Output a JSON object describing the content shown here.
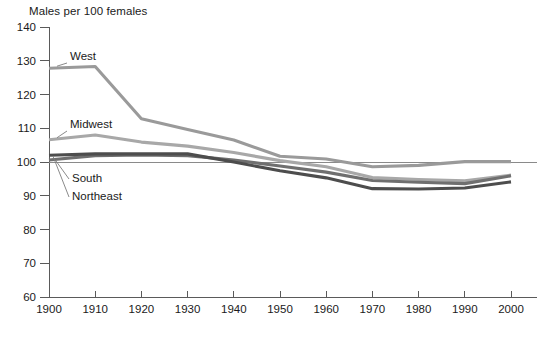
{
  "chart_data": {
    "type": "line",
    "title": "Males per 100 females",
    "xlabel": "",
    "ylabel": "Males per 100 females",
    "ylim": [
      60,
      140
    ],
    "xlim": [
      1900,
      2000
    ],
    "ytick_values": [
      60,
      70,
      80,
      90,
      100,
      110,
      120,
      130,
      140
    ],
    "ytick_labels": [
      "60",
      "70",
      "80",
      "90",
      "100",
      "110",
      "120",
      "130",
      "140"
    ],
    "grid": false,
    "reference_line": 100,
    "legend_position": "inline-labels",
    "categories": [
      1900,
      1910,
      1920,
      1930,
      1940,
      1950,
      1960,
      1970,
      1980,
      1990,
      2000
    ],
    "xtick_labels": [
      "1900",
      "1910",
      "1920",
      "1930",
      "1940",
      "1950",
      "1960",
      "1970",
      "1980",
      "1990",
      "2000"
    ],
    "series": [
      {
        "name": "West",
        "color": "#9a9a9a",
        "label": "West",
        "values": [
          127.8,
          128.3,
          112.8,
          109.6,
          106.5,
          101.7,
          100.9,
          98.6,
          99.0,
          100.1,
          100.1
        ]
      },
      {
        "name": "Midwest",
        "color": "#a8a8a8",
        "label": "Midwest",
        "values": [
          106.6,
          108.0,
          105.9,
          104.7,
          102.8,
          100.4,
          98.6,
          95.4,
          94.8,
          94.4,
          96.1
        ]
      },
      {
        "name": "South",
        "color": "#6f6f6f",
        "label": "South",
        "values": [
          100.6,
          101.9,
          102.1,
          101.9,
          100.6,
          98.8,
          97.0,
          94.5,
          94.0,
          93.6,
          95.9
        ]
      },
      {
        "name": "Northeast",
        "color": "#4d4d4d",
        "label": "Northeast",
        "values": [
          102.0,
          102.4,
          102.4,
          102.4,
          100.0,
          97.4,
          95.3,
          92.1,
          92.0,
          92.3,
          94.1
        ]
      }
    ],
    "annotations": [
      {
        "text": "West",
        "series": "West"
      },
      {
        "text": "Midwest",
        "series": "Midwest"
      },
      {
        "text": "South",
        "series": "South"
      },
      {
        "text": "Northeast",
        "series": "Northeast"
      }
    ]
  },
  "source_note": ""
}
